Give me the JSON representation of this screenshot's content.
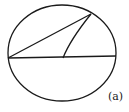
{
  "figure": {
    "label": "(a)",
    "stroke_color": "#1a1a1a",
    "background": "#ffffff",
    "circle": {
      "cx": 62,
      "cy": 53,
      "rx": 54,
      "ry": 48
    },
    "diameter": {
      "x1": 8,
      "y1": 58,
      "x2": 116,
      "y2": 56
    },
    "chord": {
      "x1": 8,
      "y1": 58,
      "x2": 91,
      "y2": 14
    },
    "radius": {
      "x1": 63,
      "y1": 58,
      "x2": 91,
      "y2": 14
    }
  }
}
